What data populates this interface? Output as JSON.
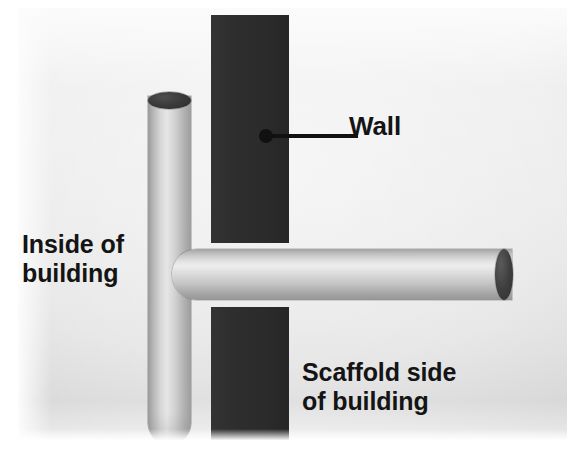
{
  "diagram": {
    "background_color": "#e9e9e9",
    "page_color": "#ffffff"
  },
  "wall": {
    "name": "Wall",
    "color": "#2e2e2e",
    "segments": [
      "upper",
      "lower"
    ]
  },
  "tubes": {
    "vertical": {
      "name": "vertical scaffold tube",
      "color": "#d8d8d8",
      "end_cap_color": "#3a3a3a",
      "orientation": "vertical"
    },
    "horizontal": {
      "name": "horizontal scaffold tube",
      "color": "#dcdcdc",
      "end_cap_color": "#3f3f3f",
      "orientation": "horizontal"
    }
  },
  "callouts": {
    "wall": {
      "text": "Wall",
      "leader": "line-with-dot"
    }
  },
  "labels": {
    "inside": "Inside of\nbuilding",
    "scaffold": "Scaffold side\nof building"
  }
}
